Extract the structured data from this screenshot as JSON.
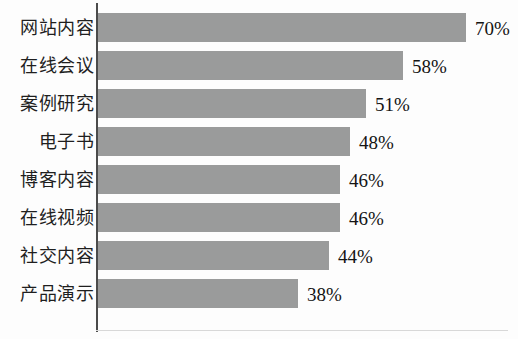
{
  "chart_data": {
    "type": "bar",
    "orientation": "horizontal",
    "title": "",
    "subtitle": "",
    "xlabel": "",
    "ylabel": "",
    "xlim": [
      0,
      78
    ],
    "grid": false,
    "legend": null,
    "value_suffix": "%",
    "bar_color": "#9a9b9b",
    "axis_color": "#4b4b4b",
    "background_color": "#fdfdfd",
    "categories": [
      "网站内容",
      "在线会议",
      "案例研究",
      "电子书",
      "博客内容",
      "在线视频",
      "社交内容",
      "产品演示"
    ],
    "values": [
      70,
      58,
      51,
      48,
      46,
      46,
      44,
      38
    ],
    "value_labels": [
      "70%",
      "58%",
      "51%",
      "48%",
      "46%",
      "46%",
      "44%",
      "38%"
    ]
  }
}
